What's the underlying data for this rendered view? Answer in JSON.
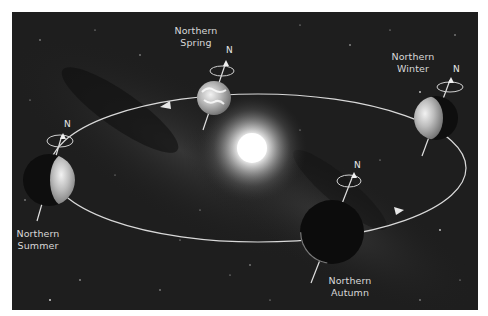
{
  "diagram": {
    "type": "seasons-orbit",
    "center_object": "Sun",
    "orbit_direction": "counter-clockwise (arrows on orbit)",
    "positions": [
      {
        "id": "spring",
        "label_line1": "Northern",
        "label_line2": "Spring",
        "axis_label": "N",
        "lit": "full"
      },
      {
        "id": "winter",
        "label_line1": "Northern",
        "label_line2": "Winter",
        "axis_label": "N",
        "lit": "left-half"
      },
      {
        "id": "summer",
        "label_line1": "Northern",
        "label_line2": "Summer",
        "axis_label": "N",
        "lit": "right-half"
      },
      {
        "id": "autumn",
        "label_line1": "Northern",
        "label_line2": "Autumn",
        "axis_label": "N",
        "lit": "rim-only"
      }
    ]
  },
  "colors": {
    "background": "#1c1c1c",
    "orbit": "#d9d9d9",
    "text": "#d8d8d8",
    "sun": "#ffffff",
    "border": "#ffffff"
  }
}
